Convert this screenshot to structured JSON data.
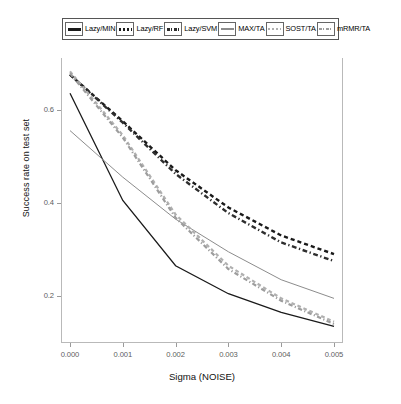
{
  "chart_data": {
    "type": "line",
    "title": "",
    "xlabel": "Sigma (NOISE)",
    "ylabel": "Success rate on test set",
    "xlim": [
      0.0,
      0.005
    ],
    "ylim": [
      0.11,
      0.7
    ],
    "xticks": [
      "0.000",
      "0.001",
      "0.002",
      "0.003",
      "0.004",
      "0.005"
    ],
    "xtick_values": [
      0.0,
      0.001,
      0.002,
      0.003,
      0.004,
      0.005
    ],
    "yticks": [
      "0.2",
      "0.4",
      "0.6"
    ],
    "ytick_values": [
      0.2,
      0.4,
      0.6
    ],
    "grid": false,
    "legend_position": "top-outside",
    "x": [
      0.0,
      0.001,
      0.002,
      0.003,
      0.004,
      0.005
    ],
    "series": [
      {
        "name": "Lazy/MIN",
        "values": [
          0.635,
          0.405,
          0.265,
          0.205,
          0.165,
          0.135
        ],
        "color": "#1a1a1a",
        "dash": "solid",
        "width": 1.3,
        "swatch": "solid-thick"
      },
      {
        "name": "Lazy/RF",
        "values": [
          0.675,
          0.575,
          0.47,
          0.39,
          0.33,
          0.29
        ],
        "color": "#1a1a1a",
        "dash": "dashed",
        "width": 2.4,
        "swatch": "dashed"
      },
      {
        "name": "Lazy/SVM",
        "values": [
          0.675,
          0.572,
          0.462,
          0.378,
          0.315,
          0.275
        ],
        "color": "#2e2e2e",
        "dash": "dashdot",
        "width": 2.4,
        "swatch": "dashdot"
      },
      {
        "name": "MAX/TA",
        "values": [
          0.555,
          0.455,
          0.365,
          0.295,
          0.235,
          0.195
        ],
        "color": "#8c8c8c",
        "dash": "solid",
        "width": 1.0,
        "swatch": "solid-thin"
      },
      {
        "name": "SOST/TA",
        "values": [
          0.682,
          0.545,
          0.375,
          0.265,
          0.195,
          0.145
        ],
        "color": "#b0b0b0",
        "dash": "dashed",
        "width": 2.2,
        "swatch": "dashed-gray"
      },
      {
        "name": "mRMR/TA",
        "values": [
          0.678,
          0.54,
          0.368,
          0.258,
          0.19,
          0.14
        ],
        "color": "#9d9d9d",
        "dash": "dashdot",
        "width": 2.2,
        "swatch": "dashdot-gray"
      }
    ]
  },
  "legend": {
    "items": [
      {
        "label": "Lazy/MIN"
      },
      {
        "label": "Lazy/RF"
      },
      {
        "label": "Lazy/SVM"
      },
      {
        "label": "MAX/TA"
      },
      {
        "label": "SOST/TA"
      },
      {
        "label": "mRMR/TA"
      }
    ]
  }
}
